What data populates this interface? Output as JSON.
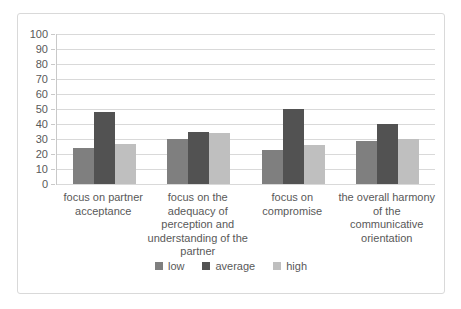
{
  "chart_data": {
    "type": "bar",
    "title": "",
    "xlabel": "",
    "ylabel": "",
    "ylim": [
      0,
      100
    ],
    "yticks": [
      0,
      10,
      20,
      30,
      40,
      50,
      60,
      70,
      80,
      90,
      100
    ],
    "grid": true,
    "legend_position": "bottom",
    "categories": [
      "focus on partner acceptance",
      "focus on the adequacy of perception and understanding of the partner",
      "focus on compromise",
      "the overall harmony of the communicative orientation"
    ],
    "categories_wrapped": [
      [
        "focus on partner",
        "acceptance"
      ],
      [
        "focus on the",
        "adequacy of",
        "perception and",
        "understanding of the",
        "partner"
      ],
      [
        "focus on",
        "compromise"
      ],
      [
        "the overall harmony",
        "of the",
        "communicative",
        "orientation"
      ]
    ],
    "series": [
      {
        "name": "low",
        "color": "#7f7f7f",
        "values": [
          24,
          30,
          23,
          29
        ]
      },
      {
        "name": "average",
        "color": "#525252",
        "values": [
          48,
          35,
          50,
          40
        ]
      },
      {
        "name": "high",
        "color": "#bfbfbf",
        "values": [
          27,
          34,
          26,
          30
        ]
      }
    ]
  },
  "colors": {
    "gridline": "#d9d9d9",
    "axis": "#c9c9c9",
    "text": "#595959",
    "frame_border": "#d9d9d9",
    "background": "#ffffff"
  }
}
